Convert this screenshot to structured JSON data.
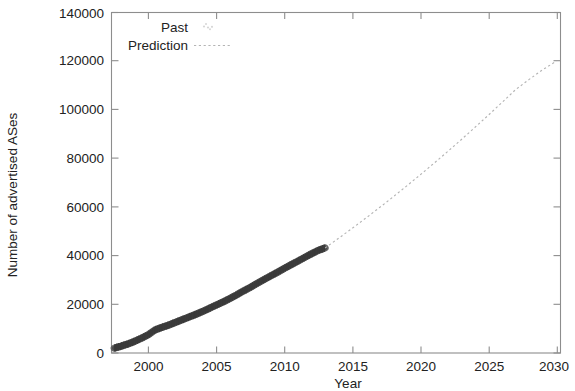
{
  "chart_data": {
    "type": "line",
    "title": "",
    "xlabel": "Year",
    "ylabel": "Number of advertised ASes",
    "xlim": [
      1997.3,
      2030.3
    ],
    "ylim": [
      0,
      140000
    ],
    "grid": false,
    "legend_position": "top-center-inside",
    "x_ticks": [
      2000,
      2005,
      2010,
      2015,
      2020,
      2025,
      2030
    ],
    "x_tick_labels": [
      "2000",
      "2005",
      "2010",
      "2015",
      "2020",
      "2025",
      "2030"
    ],
    "y_ticks": [
      0,
      20000,
      40000,
      60000,
      80000,
      100000,
      120000,
      140000
    ],
    "y_tick_labels": [
      "0",
      "20000",
      "40000",
      "60000",
      "80000",
      "100000",
      "120000",
      "140000"
    ],
    "series": [
      {
        "name": "Past",
        "style": "dense-points-band",
        "color": "#4a4a4a",
        "x": [
          1997.5,
          1998.0,
          1998.5,
          1999.0,
          1999.5,
          2000.0,
          2000.5,
          2001.0,
          2001.5,
          2002.0,
          2002.5,
          2003.0,
          2003.5,
          2004.0,
          2004.5,
          2005.0,
          2005.5,
          2006.0,
          2006.5,
          2007.0,
          2007.5,
          2008.0,
          2008.5,
          2009.0,
          2009.5,
          2010.0,
          2010.5,
          2011.0,
          2011.5,
          2012.0,
          2012.5,
          2013.0
        ],
        "y": [
          2000,
          2800,
          3700,
          4800,
          6100,
          7500,
          9500,
          10500,
          11500,
          12600,
          13700,
          14800,
          15900,
          17100,
          18400,
          19700,
          21000,
          22400,
          23900,
          25500,
          27000,
          28600,
          30200,
          31700,
          33200,
          34800,
          36300,
          37800,
          39300,
          40800,
          42200,
          43200
        ]
      },
      {
        "name": "Prediction",
        "style": "dotted-line",
        "color": "#b4b4b4",
        "x": [
          2013.0,
          2014.0,
          2015.0,
          2016.0,
          2017.0,
          2018.0,
          2019.0,
          2020.0,
          2021.0,
          2022.0,
          2023.0,
          2024.0,
          2025.0,
          2026.0,
          2027.0,
          2028.0,
          2029.0,
          2030.0
        ],
        "y": [
          43200,
          47200,
          51300,
          55500,
          59800,
          64200,
          68700,
          73300,
          78000,
          82800,
          87700,
          92700,
          97800,
          103000,
          108300,
          112500,
          116500,
          120000
        ]
      }
    ]
  },
  "legend": {
    "items": [
      {
        "label": "Past",
        "key_type": "point-marker"
      },
      {
        "label": "Prediction",
        "key_type": "dotted-line"
      }
    ]
  },
  "axes": {
    "x_title": "Year",
    "y_title": "Number of advertised ASes"
  },
  "colors": {
    "past": "#4a4a4a",
    "prediction": "#b4b4b4",
    "frame": "#8d8d8d",
    "text": "#222222",
    "background": "#ffffff"
  }
}
